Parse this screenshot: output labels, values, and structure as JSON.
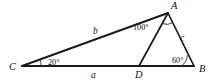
{
  "figure": {
    "background_color": "#ffffff",
    "stroke_color": "#1a1a1a",
    "width": 215,
    "height": 82
  },
  "vertices": [
    {
      "name": "A",
      "label": "A",
      "x": 168,
      "y": 13,
      "label_x": 171,
      "label_y": 9
    },
    {
      "name": "B",
      "label": "B",
      "x": 194,
      "y": 66,
      "label_x": 199,
      "label_y": 72
    },
    {
      "name": "C",
      "label": "C",
      "x": 22,
      "y": 66,
      "label_x": 9,
      "label_y": 70
    },
    {
      "name": "D",
      "label": "D",
      "x": 139,
      "y": 66,
      "label_x": 135,
      "label_y": 78
    }
  ],
  "segments": [
    {
      "name": "segment-CB",
      "from": "C",
      "to": "B",
      "x1": 22,
      "y1": 66,
      "x2": 194,
      "y2": 66
    },
    {
      "name": "segment-CA",
      "from": "C",
      "to": "A",
      "x1": 22,
      "y1": 66,
      "x2": 168,
      "y2": 13
    },
    {
      "name": "segment-AB",
      "from": "A",
      "to": "B",
      "x1": 168,
      "y1": 13,
      "x2": 194,
      "y2": 66
    },
    {
      "name": "segment-AD",
      "from": "A",
      "to": "D",
      "x1": 168,
      "y1": 13,
      "x2": 139,
      "y2": 66
    }
  ],
  "side_labels": [
    {
      "name": "side-label-a",
      "text": "a",
      "x": 91,
      "y": 78,
      "segment": "CD"
    },
    {
      "name": "side-label-b",
      "text": "b",
      "x": 93,
      "y": 34,
      "segment": "CA"
    },
    {
      "name": "side-label-c",
      "text": "c",
      "x": 180,
      "y": 41,
      "segment": "AB"
    }
  ],
  "angle_labels": [
    {
      "name": "angle-label-C",
      "text": "20°",
      "value": 20,
      "vertex": "C",
      "x": 48,
      "y": 65
    },
    {
      "name": "angle-label-B",
      "text": "60°",
      "value": 60,
      "vertex": "B",
      "x": 172,
      "y": 63
    },
    {
      "name": "angle-label-A",
      "text": "100°",
      "value": 100,
      "vertex": "A",
      "x": 133,
      "y": 30
    }
  ],
  "angle_arcs": [
    {
      "name": "angle-arc-C",
      "path": "M 41 66 A 19 19 0 0 0 40.1 59.5"
    },
    {
      "name": "angle-arc-B",
      "path": "M 181 66 A 13 13 0 0 0 187.3 55.0"
    },
    {
      "name": "angle-arc-A",
      "path": "M 162.5 24.0 A 12 12 0 0 0 173.2 23.0"
    }
  ]
}
